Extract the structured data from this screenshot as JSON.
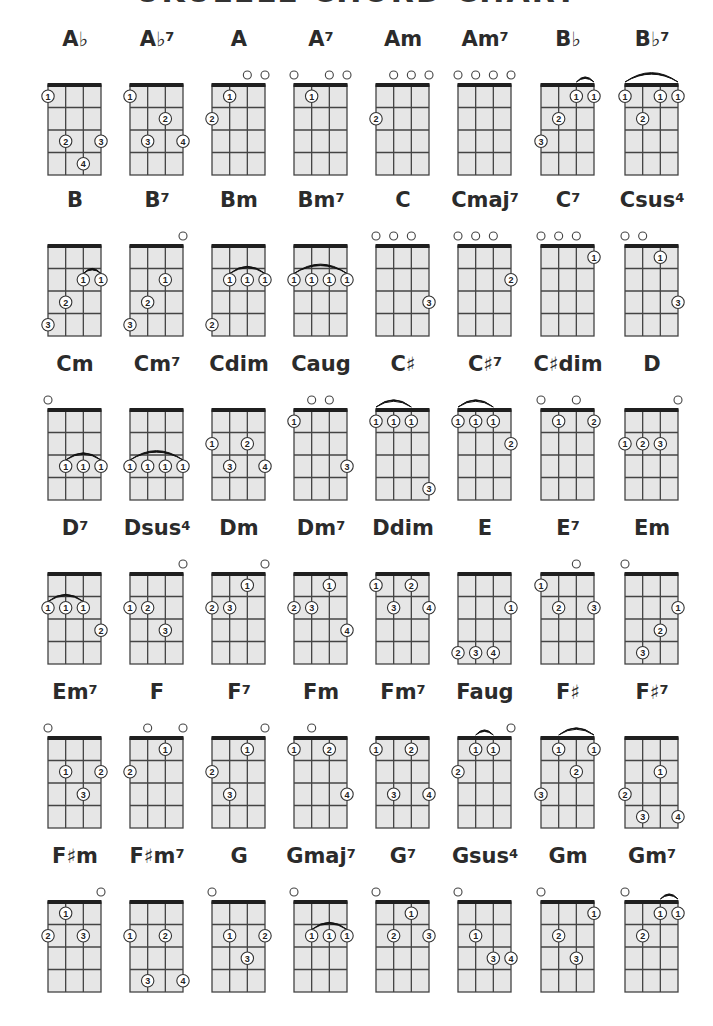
{
  "page": {
    "title": "UKULELE CHORD CHART",
    "title_visible": "partially cut off at top edge"
  },
  "layout": {
    "columns_x": [
      48,
      130,
      212,
      294,
      376,
      458,
      541,
      625
    ],
    "rows_grid_top": [
      85,
      246,
      410,
      574,
      738,
      902
    ],
    "grid_width": 53,
    "grid_height": 90,
    "strings": 4,
    "frets": 4
  },
  "colors": {
    "grid_fill": "#e6e6e6",
    "grid_lines": "#444444",
    "nut": "#1f1f1f",
    "text": "#2b2b2b",
    "dot_fill": "#ffffff",
    "dot_stroke": "#333333"
  },
  "legend": {
    "open_string_symbol": "○",
    "finger_dot_text": "finger number",
    "arc": "barre"
  },
  "chords": [
    {
      "name": "A",
      "acc": "♭",
      "sup": "",
      "open": [],
      "barres": [],
      "dots": [
        [
          1,
          1,
          1
        ],
        [
          2,
          3,
          2
        ],
        [
          4,
          3,
          3
        ],
        [
          3,
          4,
          4
        ]
      ]
    },
    {
      "name": "A",
      "acc": "♭",
      "sup": "7",
      "open": [],
      "barres": [],
      "dots": [
        [
          1,
          1,
          1
        ],
        [
          3,
          2,
          2
        ],
        [
          2,
          3,
          3
        ],
        [
          4,
          3,
          4
        ]
      ]
    },
    {
      "name": "A",
      "acc": "",
      "sup": "",
      "open": [
        3,
        4
      ],
      "barres": [],
      "dots": [
        [
          2,
          1,
          1
        ],
        [
          1,
          2,
          2
        ]
      ]
    },
    {
      "name": "A",
      "acc": "",
      "sup": "7",
      "open": [
        1,
        3,
        4
      ],
      "barres": [],
      "dots": [
        [
          2,
          1,
          1
        ]
      ]
    },
    {
      "name": "Am",
      "acc": "",
      "sup": "",
      "open": [
        2,
        3,
        4
      ],
      "barres": [],
      "dots": [
        [
          1,
          2,
          2
        ]
      ]
    },
    {
      "name": "Am",
      "acc": "",
      "sup": "7",
      "open": [
        1,
        2,
        3,
        4
      ],
      "barres": [],
      "dots": []
    },
    {
      "name": "B",
      "acc": "♭",
      "sup": "",
      "open": [],
      "barres": [
        [
          3,
          4,
          1
        ]
      ],
      "dots": [
        [
          3,
          1,
          1
        ],
        [
          4,
          1,
          1
        ],
        [
          2,
          2,
          2
        ],
        [
          1,
          3,
          3
        ]
      ]
    },
    {
      "name": "B",
      "acc": "♭",
      "sup": "7",
      "open": [],
      "barres": [
        [
          1,
          4,
          1
        ]
      ],
      "dots": [
        [
          1,
          1,
          1
        ],
        [
          3,
          1,
          1
        ],
        [
          4,
          1,
          1
        ],
        [
          2,
          2,
          2
        ]
      ]
    },
    {
      "name": "B",
      "acc": "",
      "sup": "",
      "open": [],
      "barres": [
        [
          3,
          4,
          2
        ]
      ],
      "dots": [
        [
          3,
          2,
          1
        ],
        [
          4,
          2,
          1
        ],
        [
          2,
          3,
          2
        ],
        [
          1,
          4,
          3
        ]
      ]
    },
    {
      "name": "B",
      "acc": "",
      "sup": "7",
      "open": [
        4
      ],
      "barres": [],
      "dots": [
        [
          3,
          2,
          1
        ],
        [
          2,
          3,
          2
        ],
        [
          1,
          4,
          3
        ]
      ]
    },
    {
      "name": "Bm",
      "acc": "",
      "sup": "",
      "open": [],
      "barres": [
        [
          2,
          4,
          2
        ]
      ],
      "dots": [
        [
          2,
          2,
          1
        ],
        [
          3,
          2,
          1
        ],
        [
          4,
          2,
          1
        ],
        [
          1,
          4,
          2
        ]
      ]
    },
    {
      "name": "Bm",
      "acc": "",
      "sup": "7",
      "open": [],
      "barres": [
        [
          1,
          4,
          2
        ]
      ],
      "dots": [
        [
          1,
          2,
          1
        ],
        [
          2,
          2,
          1
        ],
        [
          3,
          2,
          1
        ],
        [
          4,
          2,
          1
        ]
      ]
    },
    {
      "name": "C",
      "acc": "",
      "sup": "",
      "open": [
        1,
        2,
        3
      ],
      "barres": [],
      "dots": [
        [
          4,
          3,
          3
        ]
      ]
    },
    {
      "name": "Cmaj",
      "acc": "",
      "sup": "7",
      "open": [
        1,
        2,
        3
      ],
      "barres": [],
      "dots": [
        [
          4,
          2,
          2
        ]
      ]
    },
    {
      "name": "C",
      "acc": "",
      "sup": "7",
      "open": [
        1,
        2,
        3
      ],
      "barres": [],
      "dots": [
        [
          4,
          1,
          1
        ]
      ]
    },
    {
      "name": "Csus",
      "acc": "",
      "sup": "4",
      "open": [
        1,
        2
      ],
      "barres": [],
      "dots": [
        [
          3,
          1,
          1
        ],
        [
          4,
          3,
          3
        ]
      ]
    },
    {
      "name": "Cm",
      "acc": "",
      "sup": "",
      "open": [
        1
      ],
      "barres": [
        [
          2,
          4,
          3
        ]
      ],
      "dots": [
        [
          2,
          3,
          1
        ],
        [
          3,
          3,
          1
        ],
        [
          4,
          3,
          1
        ]
      ]
    },
    {
      "name": "Cm",
      "acc": "",
      "sup": "7",
      "open": [],
      "barres": [
        [
          1,
          4,
          3
        ]
      ],
      "dots": [
        [
          1,
          3,
          1
        ],
        [
          2,
          3,
          1
        ],
        [
          3,
          3,
          1
        ],
        [
          4,
          3,
          1
        ]
      ]
    },
    {
      "name": "Cdim",
      "acc": "",
      "sup": "",
      "open": [],
      "barres": [],
      "dots": [
        [
          1,
          2,
          1
        ],
        [
          3,
          2,
          2
        ],
        [
          2,
          3,
          3
        ],
        [
          4,
          3,
          4
        ]
      ]
    },
    {
      "name": "Caug",
      "acc": "",
      "sup": "",
      "open": [
        2,
        3
      ],
      "barres": [],
      "dots": [
        [
          1,
          1,
          1
        ],
        [
          4,
          3,
          3
        ]
      ]
    },
    {
      "name": "C",
      "acc": "♯",
      "sup": "",
      "open": [],
      "barres": [
        [
          1,
          3,
          1
        ]
      ],
      "dots": [
        [
          1,
          1,
          1
        ],
        [
          2,
          1,
          1
        ],
        [
          3,
          1,
          1
        ],
        [
          4,
          4,
          3
        ]
      ]
    },
    {
      "name": "C",
      "acc": "♯",
      "sup": "7",
      "open": [],
      "barres": [
        [
          1,
          3,
          1
        ]
      ],
      "dots": [
        [
          1,
          1,
          1
        ],
        [
          2,
          1,
          1
        ],
        [
          3,
          1,
          1
        ],
        [
          4,
          2,
          2
        ]
      ]
    },
    {
      "name": "C",
      "acc": "♯",
      "sup": "",
      "suffix": "dim",
      "open": [
        1,
        3
      ],
      "barres": [],
      "dots": [
        [
          2,
          1,
          1
        ],
        [
          4,
          1,
          2
        ]
      ]
    },
    {
      "name": "D",
      "acc": "",
      "sup": "",
      "open": [
        4
      ],
      "barres": [],
      "dots": [
        [
          1,
          2,
          1
        ],
        [
          2,
          2,
          2
        ],
        [
          3,
          2,
          3
        ]
      ]
    },
    {
      "name": "D",
      "acc": "",
      "sup": "7",
      "open": [],
      "barres": [
        [
          1,
          3,
          2
        ]
      ],
      "dots": [
        [
          1,
          2,
          1
        ],
        [
          2,
          2,
          1
        ],
        [
          3,
          2,
          1
        ],
        [
          4,
          3,
          2
        ]
      ]
    },
    {
      "name": "Dsus",
      "acc": "",
      "sup": "4",
      "open": [
        4
      ],
      "barres": [],
      "dots": [
        [
          1,
          2,
          1
        ],
        [
          2,
          2,
          2
        ],
        [
          3,
          3,
          3
        ]
      ]
    },
    {
      "name": "Dm",
      "acc": "",
      "sup": "",
      "open": [
        4
      ],
      "barres": [],
      "dots": [
        [
          3,
          1,
          1
        ],
        [
          1,
          2,
          2
        ],
        [
          2,
          2,
          3
        ]
      ]
    },
    {
      "name": "Dm",
      "acc": "",
      "sup": "7",
      "open": [],
      "barres": [],
      "dots": [
        [
          3,
          1,
          1
        ],
        [
          1,
          2,
          2
        ],
        [
          2,
          2,
          3
        ],
        [
          4,
          3,
          4
        ]
      ]
    },
    {
      "name": "Ddim",
      "acc": "",
      "sup": "",
      "open": [],
      "barres": [],
      "dots": [
        [
          1,
          1,
          1
        ],
        [
          3,
          1,
          2
        ],
        [
          2,
          2,
          3
        ],
        [
          4,
          2,
          4
        ]
      ]
    },
    {
      "name": "E",
      "acc": "",
      "sup": "",
      "open": [],
      "barres": [],
      "dots": [
        [
          4,
          2,
          1
        ],
        [
          1,
          4,
          2
        ],
        [
          2,
          4,
          3
        ],
        [
          3,
          4,
          4
        ]
      ]
    },
    {
      "name": "E",
      "acc": "",
      "sup": "7",
      "open": [
        3
      ],
      "barres": [],
      "dots": [
        [
          1,
          1,
          1
        ],
        [
          2,
          2,
          2
        ],
        [
          4,
          2,
          3
        ]
      ]
    },
    {
      "name": "Em",
      "acc": "",
      "sup": "",
      "open": [
        1
      ],
      "barres": [],
      "dots": [
        [
          4,
          2,
          1
        ],
        [
          3,
          3,
          2
        ],
        [
          2,
          4,
          3
        ]
      ]
    },
    {
      "name": "Em",
      "acc": "",
      "sup": "7",
      "open": [
        1
      ],
      "barres": [],
      "dots": [
        [
          2,
          2,
          1
        ],
        [
          4,
          2,
          2
        ],
        [
          3,
          3,
          3
        ]
      ]
    },
    {
      "name": "F",
      "acc": "",
      "sup": "",
      "open": [
        2,
        4
      ],
      "barres": [],
      "dots": [
        [
          3,
          1,
          1
        ],
        [
          1,
          2,
          2
        ]
      ]
    },
    {
      "name": "F",
      "acc": "",
      "sup": "7",
      "open": [
        4
      ],
      "barres": [],
      "dots": [
        [
          3,
          1,
          1
        ],
        [
          1,
          2,
          2
        ],
        [
          2,
          3,
          3
        ]
      ]
    },
    {
      "name": "Fm",
      "acc": "",
      "sup": "",
      "open": [
        2
      ],
      "barres": [],
      "dots": [
        [
          1,
          1,
          1
        ],
        [
          3,
          1,
          2
        ],
        [
          4,
          3,
          4
        ]
      ]
    },
    {
      "name": "Fm",
      "acc": "",
      "sup": "7",
      "open": [],
      "barres": [],
      "dots": [
        [
          1,
          1,
          1
        ],
        [
          3,
          1,
          2
        ],
        [
          2,
          3,
          3
        ],
        [
          4,
          3,
          4
        ]
      ]
    },
    {
      "name": "Faug",
      "acc": "",
      "sup": "",
      "open": [
        4
      ],
      "barres": [
        [
          2,
          3,
          1
        ]
      ],
      "dots": [
        [
          2,
          1,
          1
        ],
        [
          3,
          1,
          1
        ],
        [
          1,
          2,
          2
        ]
      ]
    },
    {
      "name": "F",
      "acc": "♯",
      "sup": "",
      "open": [],
      "barres": [
        [
          2,
          4,
          1
        ]
      ],
      "dots": [
        [
          2,
          1,
          1
        ],
        [
          4,
          1,
          1
        ],
        [
          3,
          2,
          2
        ],
        [
          1,
          3,
          3
        ]
      ]
    },
    {
      "name": "F",
      "acc": "♯",
      "sup": "7",
      "open": [],
      "barres": [],
      "dots": [
        [
          3,
          2,
          1
        ],
        [
          1,
          3,
          2
        ],
        [
          2,
          4,
          3
        ],
        [
          4,
          4,
          4
        ]
      ]
    },
    {
      "name": "F",
      "acc": "♯",
      "sup": "",
      "suffix": "m",
      "open": [
        4
      ],
      "barres": [],
      "dots": [
        [
          2,
          1,
          1
        ],
        [
          1,
          2,
          2
        ],
        [
          3,
          2,
          3
        ]
      ]
    },
    {
      "name": "F",
      "acc": "♯",
      "sup": "7",
      "suffix": "m",
      "open": [],
      "barres": [],
      "dots": [
        [
          1,
          2,
          1
        ],
        [
          3,
          2,
          2
        ],
        [
          2,
          4,
          3
        ],
        [
          4,
          4,
          4
        ]
      ]
    },
    {
      "name": "G",
      "acc": "",
      "sup": "",
      "open": [
        1
      ],
      "barres": [],
      "dots": [
        [
          2,
          2,
          1
        ],
        [
          4,
          2,
          2
        ],
        [
          3,
          3,
          3
        ]
      ]
    },
    {
      "name": "Gmaj",
      "acc": "",
      "sup": "7",
      "open": [
        1
      ],
      "barres": [
        [
          2,
          4,
          2
        ]
      ],
      "dots": [
        [
          2,
          2,
          1
        ],
        [
          3,
          2,
          1
        ],
        [
          4,
          2,
          1
        ]
      ]
    },
    {
      "name": "G",
      "acc": "",
      "sup": "7",
      "open": [
        1
      ],
      "barres": [],
      "dots": [
        [
          3,
          1,
          1
        ],
        [
          2,
          2,
          2
        ],
        [
          4,
          2,
          3
        ]
      ]
    },
    {
      "name": "Gsus",
      "acc": "",
      "sup": "4",
      "open": [
        1
      ],
      "barres": [],
      "dots": [
        [
          2,
          2,
          1
        ],
        [
          3,
          3,
          3
        ],
        [
          4,
          3,
          4
        ]
      ]
    },
    {
      "name": "Gm",
      "acc": "",
      "sup": "",
      "open": [
        1
      ],
      "barres": [],
      "dots": [
        [
          4,
          1,
          1
        ],
        [
          2,
          2,
          2
        ],
        [
          3,
          3,
          3
        ]
      ]
    },
    {
      "name": "Gm",
      "acc": "",
      "sup": "7",
      "open": [
        1
      ],
      "barres": [
        [
          3,
          4,
          1
        ]
      ],
      "dots": [
        [
          3,
          1,
          1
        ],
        [
          4,
          1,
          1
        ],
        [
          2,
          2,
          2
        ]
      ]
    }
  ]
}
